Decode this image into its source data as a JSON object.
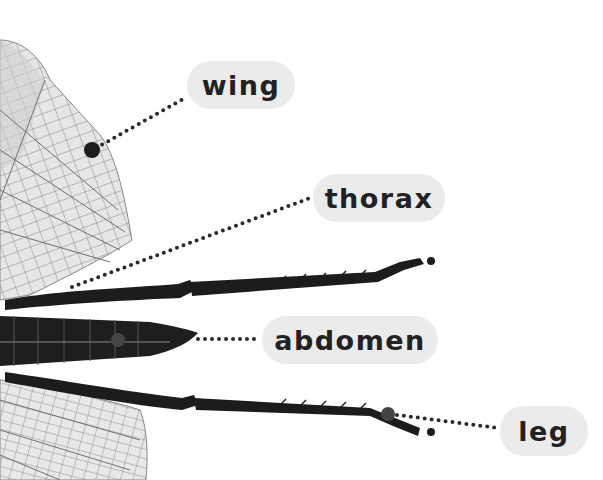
{
  "diagram": {
    "labels": [
      {
        "id": "wing",
        "text": "wing",
        "x": 187,
        "y": 61,
        "w": 108,
        "h": 48,
        "anchor": [
          92,
          150
        ]
      },
      {
        "id": "thorax",
        "text": "thorax",
        "x": 313,
        "y": 174,
        "w": 132,
        "h": 48,
        "anchor": [
          72,
          287
        ]
      },
      {
        "id": "abdomen",
        "text": "abdomen",
        "x": 262,
        "y": 316,
        "w": 176,
        "h": 48,
        "anchor": [
          196,
          338
        ]
      },
      {
        "id": "leg",
        "text": "leg",
        "x": 500,
        "y": 406,
        "w": 88,
        "h": 50,
        "anchor": [
          388,
          414
        ]
      }
    ],
    "colors": {
      "pill_bg": "#ebebeb",
      "label_text": "#222222",
      "leader_dots": "#2a2a2a",
      "insect_body": "#1c1c1c",
      "wing_fill": "#e4e4e4",
      "wing_veins": "#7a7a7a"
    }
  }
}
